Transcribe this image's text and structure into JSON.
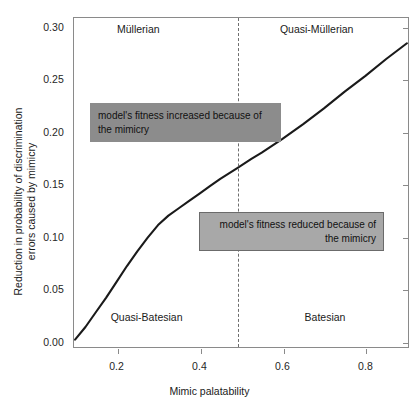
{
  "chart_data": {
    "type": "line",
    "title": "",
    "xlabel": "Mimic palatability",
    "ylabel_line1": "Reduction in probability of discrimination",
    "ylabel_line2": "errors caused by mimicry",
    "xlim": [
      0.095,
      0.905
    ],
    "ylim": [
      -0.006,
      0.309
    ],
    "xticks": [
      0.2,
      0.4,
      0.6,
      0.8
    ],
    "xtick_labels": [
      "0.2",
      "0.4",
      "0.6",
      "0.8"
    ],
    "yticks": [
      0.0,
      0.05,
      0.1,
      0.15,
      0.2,
      0.25,
      0.3
    ],
    "ytick_labels": [
      "0.00",
      "0.05",
      "0.10",
      "0.15",
      "0.20",
      "0.25",
      "0.30"
    ],
    "grid": false,
    "legend": "none",
    "series": [
      {
        "name": "Reduction in discrimination errors",
        "color": "#1a1a1a",
        "x": [
          0.1,
          0.125,
          0.15,
          0.175,
          0.2,
          0.225,
          0.25,
          0.275,
          0.3,
          0.325,
          0.35,
          0.375,
          0.4,
          0.425,
          0.45,
          0.49,
          0.525,
          0.55,
          0.6,
          0.65,
          0.7,
          0.75,
          0.8,
          0.85,
          0.9
        ],
        "y": [
          0.002,
          0.014,
          0.028,
          0.042,
          0.057,
          0.072,
          0.086,
          0.099,
          0.111,
          0.12,
          0.127,
          0.134,
          0.141,
          0.148,
          0.155,
          0.165,
          0.174,
          0.18,
          0.193,
          0.207,
          0.222,
          0.238,
          0.253,
          0.269,
          0.284
        ]
      }
    ],
    "reference_line": {
      "name": "palatability-threshold",
      "orientation": "vertical",
      "x": 0.49,
      "style": "dashed",
      "color": "#6e6e6e"
    },
    "region_labels": [
      {
        "id": "mullerian",
        "text": "Müllerian",
        "x": 0.25,
        "y": 0.298
      },
      {
        "id": "quasi-mullerian",
        "text": "Quasi-Müllerian",
        "x": 0.68,
        "y": 0.298
      },
      {
        "id": "quasi-batesian",
        "text": "Quasi-Batesian",
        "x": 0.27,
        "y": 0.024
      },
      {
        "id": "batesian",
        "text": "Batesian",
        "x": 0.7,
        "y": 0.024
      }
    ],
    "annotations": [
      {
        "id": "fitness-increased",
        "line1": "model's fitness increased because of",
        "line2": "the mimicry",
        "align": "left",
        "fill": "#8c8c8c",
        "border": "#8c8c8c"
      },
      {
        "id": "fitness-reduced",
        "line1": "model's fitness reduced because of",
        "line2": "the mimicry",
        "align": "right",
        "fill": "#a8a8a8",
        "border": "#6b6b6b"
      }
    ]
  }
}
